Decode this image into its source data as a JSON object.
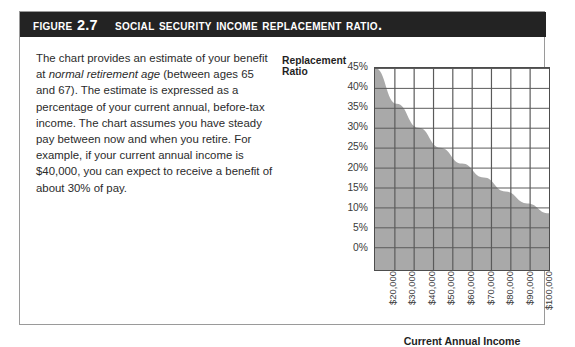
{
  "figure": {
    "label": "Figure 2.7",
    "title": "Social Security income replacement ratio.",
    "banner_color": "#232323",
    "border_color": "#9a9a9a"
  },
  "description": {
    "part1": "The chart provides an estimate of your benefit at ",
    "emphasis": "normal retirement age",
    "part2": " (between ages 65 and 67). The estimate is expressed as a percentage of your current annual, before-tax income. The chart assumes you have steady pay between now and when you retire. For example, if your current annual income is $40,000, you can expect to receive a benefit of about 30% of pay."
  },
  "chart_data": {
    "type": "area",
    "title": "",
    "xlabel": "Current Annual Income",
    "ylabel": "Replacement Ratio",
    "ylabel_line1": "Replacement",
    "ylabel_line2": "Ratio",
    "categories": [
      "$20,000",
      "$30,000",
      "$40,000",
      "$50,000",
      "$60,000",
      "$70,000",
      "$80,000",
      "$90,000",
      "$100,000"
    ],
    "x": [
      20000,
      30000,
      40000,
      50000,
      60000,
      70000,
      80000,
      90000,
      100000
    ],
    "values": [
      45,
      36,
      30,
      25,
      21,
      17.5,
      14,
      11,
      8.5
    ],
    "ytick_labels": [
      "45%",
      "40%",
      "35%",
      "30%",
      "25%",
      "20%",
      "15%",
      "10%",
      "5%",
      "0%"
    ],
    "ytick_values": [
      45,
      40,
      35,
      30,
      25,
      20,
      15,
      10,
      5,
      0
    ],
    "ylim": [
      0,
      45
    ],
    "xlim": [
      20000,
      100000
    ],
    "grid": true,
    "legend": "none",
    "fill_color": "#a9a9a9",
    "grid_color": "#5a5a5a",
    "axis_color": "#4d4d4d"
  }
}
